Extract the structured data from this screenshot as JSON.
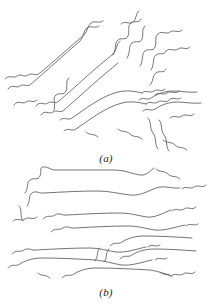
{
  "figure": {
    "background_color": "#ffffff",
    "stroke_color": "#5b5b5e",
    "stroke_width": 0.85,
    "width": 212,
    "height": 308,
    "panels": [
      {
        "id": "a",
        "label": "(a)",
        "description": "randomly oriented entangled polymer chains",
        "chain_count": 14
      },
      {
        "id": "b",
        "label": "(b)",
        "description": "aligned drawn polymer chains oriented horizontally",
        "chain_count": 13
      }
    ]
  },
  "chart_data": {
    "type": "line",
    "title": "",
    "xlabel": "",
    "ylabel": "",
    "grid": false,
    "legend": null,
    "series": [
      {
        "name": "panel-a-chains",
        "panel": "a",
        "orientation": "random-diagonal",
        "paths": [
          "M 5 79 C 9 74 13 79 17 76 C 21 73 24 78 28 75 C 32 72 36 77 40 73 C 46 68 54 61 62 54 C 70 47 78 40 84 35 C 88 31 87 26 91 23 C 95 20 99 24 103 21",
          "M 8 89 C 12 83 16 89 20 86 C 24 83 27 88 31 84 C 37 79 46 71 55 63 C 64 55 73 47 80 41 C 84 37 83 31 87 28 C 91 25 95 29 99 26",
          "M 36 106 C 40 100 44 106 48 103 C 52 100 55 105 59 101 C 66 95 76 86 86 77 C 96 68 106 60 113 54 C 117 50 116 44 120 41",
          "M 41 115 C 45 109 49 115 53 112 C 57 109 60 114 64 110 C 71 104 81 95 91 86 C 101 77 111 69 118 63",
          "M 14 105 C 18 99 22 105 26 102 C 30 99 33 104 37 100",
          "M 54 110 C 56 104 52 98 56 95 C 60 92 64 96 66 91 C 68 86 65 81 69 78",
          "M 60 120 C 64 116 68 121 72 118 C 78 114 86 108 94 103 C 102 98 110 94 118 92 C 126 90 134 91 142 93",
          "M 64 131 C 68 127 72 132 76 129 C 82 125 90 119 98 114 C 106 109 114 105 122 103 C 130 101 138 102 146 104",
          "M 142 93 C 146 89 150 94 154 91 C 158 88 161 93 165 89",
          "M 146 104 C 150 100 154 105 158 102 C 162 99 165 104 169 100 C 173 96 177 101 181 98",
          "M 121 24 C 125 20 129 25 133 22 C 137 19 135 14 139 11",
          "M 113 55 C 117 49 114 43 118 40 C 122 37 126 41 128 36 C 130 31 127 26 131 23 C 135 20 139 24 141 19",
          "M 127 58 C 131 52 128 46 132 43 C 136 40 140 44 142 39 C 144 34 141 29 145 26",
          "M 140 66 C 144 60 141 54 145 51 C 149 48 153 52 155 47 C 157 42 154 37 158 34",
          "M 151 70 C 155 64 152 58 156 55 C 160 52 164 56 166 51",
          "M 166 51 C 170 47 174 52 178 49 C 182 46 186 51 190 47",
          "M 158 34 C 162 30 166 35 170 32 C 174 29 178 34 182 30",
          "M 139 100 C 143 96 147 101 151 98 C 157 94 165 91 173 91 C 181 91 189 93 197 92",
          "M 143 111 C 147 107 151 112 155 109 C 161 105 169 102 177 102 C 185 102 193 104 201 103",
          "M 150 85 C 154 81 152 76 156 73 C 160 70 164 74 166 69",
          "M 148 118 C 152 122 149 128 153 133 C 157 138 154 144 158 149",
          "M 159 120 C 163 124 160 130 164 135 C 168 140 165 146 169 151",
          "M 170 118 C 174 114 178 119 182 116 C 186 113 190 118 194 114",
          "M 118 129 C 122 133 126 130 130 134 C 134 138 138 135 142 139",
          "M 86 132 C 90 136 94 133 98 137",
          "M 155 95 C 159 91 163 96 167 93 C 171 90 175 95 179 91",
          "M 163 140 C 167 144 171 141 175 145 C 179 149 183 146 187 150"
        ]
      },
      {
        "name": "panel-b-chains",
        "panel": "b",
        "orientation": "horizontal-aligned",
        "paths": [
          "M 25 27 C 29 22 26 17 30 14 C 34 11 38 15 40 10 C 42 5 39 2 43 1 C 47 0 51 4 55 4 C 75 4 95 4 115 4 C 125 4 132 8 140 9 C 146 10 150 5 154 2",
          "M 27 40 C 31 35 28 30 32 27 C 36 24 40 28 44 27 C 62 26 80 25 98 25 C 110 25 120 28 130 29 C 140 30 148 25 156 22 C 164 19 172 23 180 22",
          "M 43 53 C 47 48 51 52 55 49 C 59 46 63 50 67 49 C 85 48 103 47 121 47 C 131 47 139 50 147 51 C 155 52 163 47 171 44",
          "M 51 66 C 55 61 59 65 63 62 C 67 59 71 63 75 62 C 93 61 111 60 129 60 C 139 60 147 63 155 64 C 165 65 175 61 185 59",
          "M 12 88 C 16 83 20 87 24 84 C 28 81 32 85 36 84 C 54 83 72 82 90 82 C 100 82 108 85 116 86 C 126 87 136 83 146 81",
          "M 8 102 C 12 97 16 101 20 98 C 26 94 34 92 42 92 C 60 92 78 93 96 94 C 106 95 114 98 122 99 C 132 100 142 96 152 94",
          "M 62 112 C 66 107 70 111 74 108 C 80 104 88 102 96 102 C 114 102 132 103 150 104 C 158 105 164 108 170 109",
          "M 110 80 C 114 75 118 79 122 76 C 128 72 136 70 144 70 C 160 70 176 71 192 72",
          "M 120 93 C 124 88 128 92 132 89 C 138 85 146 83 154 83 C 168 83 182 84 196 85",
          "M 156 3 C 160 7 164 4 168 8 C 172 12 176 9 180 13",
          "M 182 23 C 186 19 190 24 194 21 C 198 18 202 23 206 19",
          "M 172 45 C 176 41 180 46 184 43 C 188 40 192 45 196 41",
          "M 186 60 C 190 56 194 61 198 58",
          "M 148 81 C 152 77 156 82 160 79",
          "M 155 94 C 159 90 163 95 167 92",
          "M 171 110 C 175 106 179 111 183 108 C 187 105 191 110 195 106",
          "M 13 55 C 17 51 21 56 25 53 C 29 50 33 55 37 51",
          "M 19 40 C 23 44 19 50 23 55",
          "M 95 95 C 99 90 96 85 100 82",
          "M 104 96 C 108 91 105 86 109 83",
          "M 38 107 C 42 111 46 108 50 112",
          "M 160 106 C 164 110 168 107 172 111"
        ]
      }
    ]
  }
}
